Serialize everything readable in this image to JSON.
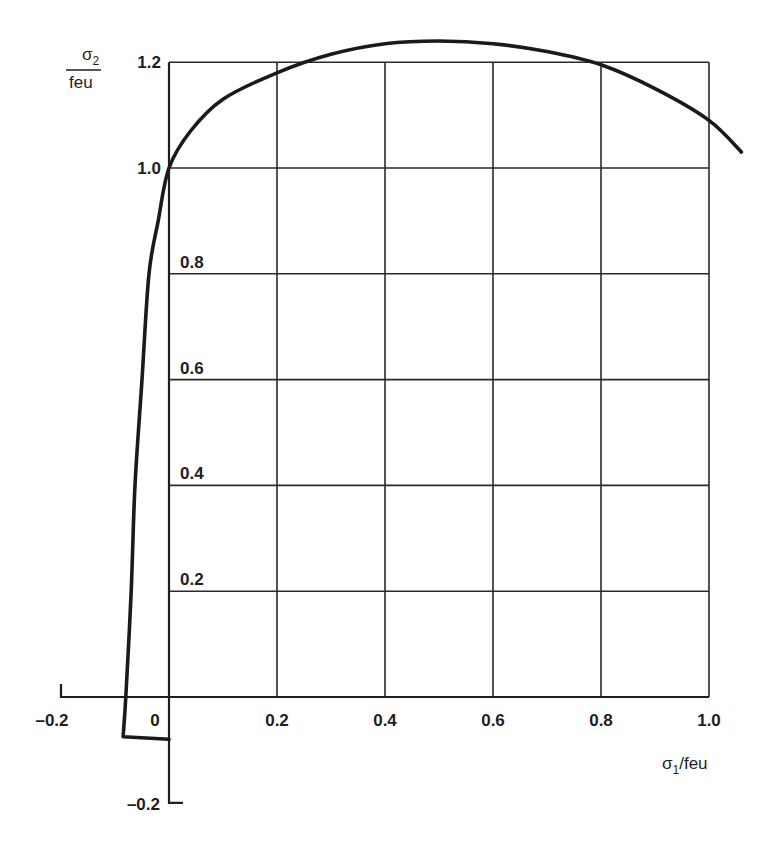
{
  "chart_data": {
    "type": "line",
    "title": "",
    "xlabel": "σ1/feu",
    "ylabel": "σ2/feu",
    "xlabel_parts": {
      "symbol": "σ",
      "sub": "1",
      "rest": "/feu"
    },
    "ylabel_parts": {
      "numerator_symbol": "σ",
      "numerator_sub": "2",
      "denominator": "feu"
    },
    "xlim": [
      -0.2,
      1.0
    ],
    "ylim": [
      -0.2,
      1.2
    ],
    "grid": true,
    "legend": null,
    "x_ticks": [
      -0.2,
      0,
      0.2,
      0.4,
      0.6,
      0.8,
      1.0
    ],
    "x_tick_labels": [
      "–0.2",
      "0",
      "0.2",
      "0.4",
      "0.6",
      "0.8",
      "1.0"
    ],
    "y_ticks": [
      -0.2,
      0.2,
      0.4,
      0.6,
      0.8,
      1.0,
      1.2
    ],
    "y_tick_labels": [
      "–0.2",
      "0.2",
      "0.4",
      "0.6",
      "0.8",
      "1.0",
      "1.2"
    ],
    "series": [
      {
        "name": "biaxial failure envelope",
        "x": [
          0,
          -0.085,
          -0.085,
          -0.08,
          -0.07,
          -0.063,
          -0.05,
          -0.037,
          -0.02,
          0,
          0.04,
          0.1,
          0.2,
          0.3,
          0.4,
          0.5,
          0.6,
          0.7,
          0.8,
          0.9,
          1.0,
          1.06
        ],
        "y": [
          -0.08,
          -0.075,
          -0.075,
          0,
          0.2,
          0.4,
          0.6,
          0.8,
          0.9,
          1.0,
          1.07,
          1.13,
          1.18,
          1.215,
          1.235,
          1.24,
          1.235,
          1.22,
          1.195,
          1.15,
          1.09,
          1.03
        ]
      }
    ]
  }
}
